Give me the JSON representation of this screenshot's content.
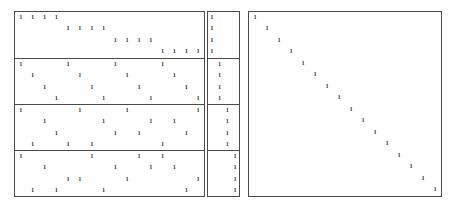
{
  "figure": {
    "symbol": "1",
    "background_color": "#ffffff",
    "border_color": "#4a4a4a",
    "symbol_color": "#111111"
  },
  "panels": [
    {
      "name": "left-panel",
      "rows": 16,
      "cols": 16,
      "group_size": 4,
      "groups": [
        {
          "name": "block-diagonal-group",
          "rows": [
            {
              "cols": [
                0,
                1,
                2,
                3
              ]
            },
            {
              "cols": [
                4,
                5,
                6,
                7
              ]
            },
            {
              "cols": [
                8,
                9,
                10,
                11
              ]
            },
            {
              "cols": [
                12,
                13,
                14,
                15
              ]
            }
          ]
        },
        {
          "name": "strided-group",
          "rows": [
            {
              "cols": [
                0,
                4,
                8,
                12
              ]
            },
            {
              "cols": [
                1,
                5,
                9,
                13
              ]
            },
            {
              "cols": [
                2,
                6,
                10,
                14
              ]
            },
            {
              "cols": [
                3,
                7,
                11,
                15
              ]
            }
          ]
        },
        {
          "name": "scattered-group-a",
          "rows": [
            {
              "cols": [
                0,
                5,
                9,
                15
              ]
            },
            {
              "cols": [
                2,
                7,
                11,
                13
              ]
            },
            {
              "cols": [
                3,
                8,
                10,
                14
              ]
            },
            {
              "cols": [
                1,
                4,
                6,
                12
              ]
            }
          ]
        },
        {
          "name": "scattered-group-b",
          "rows": [
            {
              "cols": [
                0,
                6,
                10,
                12
              ]
            },
            {
              "cols": [
                2,
                8,
                11,
                13
              ]
            },
            {
              "cols": [
                4,
                5,
                9,
                15
              ]
            },
            {
              "cols": [
                1,
                3,
                7,
                14
              ]
            }
          ]
        }
      ]
    },
    {
      "name": "middle-panel",
      "rows": 16,
      "cols": 4,
      "group_size": 4,
      "groups": [
        {
          "name": "staircase-group-1",
          "rows": [
            {
              "cols": [
                0
              ]
            },
            {
              "cols": [
                0
              ]
            },
            {
              "cols": [
                0
              ]
            },
            {
              "cols": [
                0
              ]
            }
          ]
        },
        {
          "name": "staircase-group-2",
          "rows": [
            {
              "cols": [
                1
              ]
            },
            {
              "cols": [
                1
              ]
            },
            {
              "cols": [
                1
              ]
            },
            {
              "cols": [
                1
              ]
            }
          ]
        },
        {
          "name": "staircase-group-3",
          "rows": [
            {
              "cols": [
                2
              ]
            },
            {
              "cols": [
                2
              ]
            },
            {
              "cols": [
                2
              ]
            },
            {
              "cols": [
                2
              ]
            }
          ]
        },
        {
          "name": "staircase-group-4",
          "rows": [
            {
              "cols": [
                3
              ]
            },
            {
              "cols": [
                3
              ]
            },
            {
              "cols": [
                3
              ]
            },
            {
              "cols": [
                3
              ]
            }
          ]
        }
      ]
    },
    {
      "name": "right-panel",
      "rows": 16,
      "cols": 16,
      "group_size": 16,
      "groups": [
        {
          "name": "identity-group",
          "rows": [
            {
              "cols": [
                0
              ]
            },
            {
              "cols": [
                1
              ]
            },
            {
              "cols": [
                2
              ]
            },
            {
              "cols": [
                3
              ]
            },
            {
              "cols": [
                4
              ]
            },
            {
              "cols": [
                5
              ]
            },
            {
              "cols": [
                6
              ]
            },
            {
              "cols": [
                7
              ]
            },
            {
              "cols": [
                8
              ]
            },
            {
              "cols": [
                9
              ]
            },
            {
              "cols": [
                10
              ]
            },
            {
              "cols": [
                11
              ]
            },
            {
              "cols": [
                12
              ]
            },
            {
              "cols": [
                13
              ]
            },
            {
              "cols": [
                14
              ]
            },
            {
              "cols": [
                15
              ]
            }
          ]
        }
      ]
    }
  ]
}
